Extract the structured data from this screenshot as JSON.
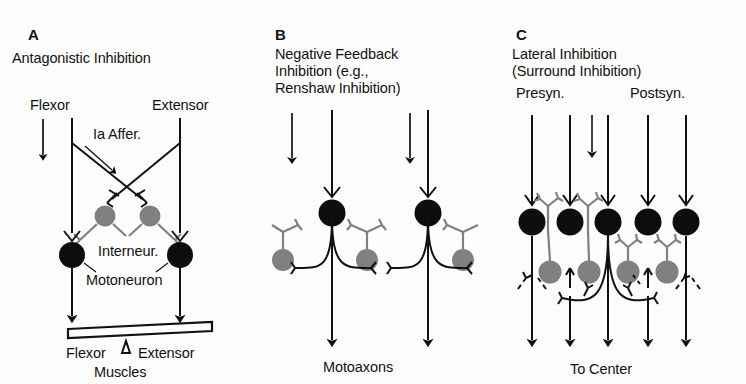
{
  "figure": {
    "background": "#fdfdfd",
    "ink": "#111111",
    "interneuron_gray": "#808080",
    "soma_black": "#0d0d0d"
  },
  "panels": [
    {
      "letter": "A",
      "title_line1": "Antagonistic Inhibition",
      "labels": {
        "left_input": "Flexor",
        "right_input": "Extensor",
        "afferent": "Ia Affer.",
        "interneuron": "Interneur.",
        "motoneuron": "Motoneuron",
        "muscle_left": "Flexor",
        "muscle_right": "Extensor",
        "muscle_caption": "Muscles"
      }
    },
    {
      "letter": "B",
      "title_line1": "Negative Feedback",
      "title_line2": "Inhibition (e.g.,",
      "title_line3": "Renshaw Inhibition)",
      "labels": {
        "output": "Motoaxons"
      }
    },
    {
      "letter": "C",
      "title_line1": "Lateral Inhibition",
      "title_line2": "(Surround Inhibition)",
      "labels": {
        "presyn": "Presyn.",
        "postsyn": "Postsyn.",
        "output": "To Center"
      }
    }
  ]
}
